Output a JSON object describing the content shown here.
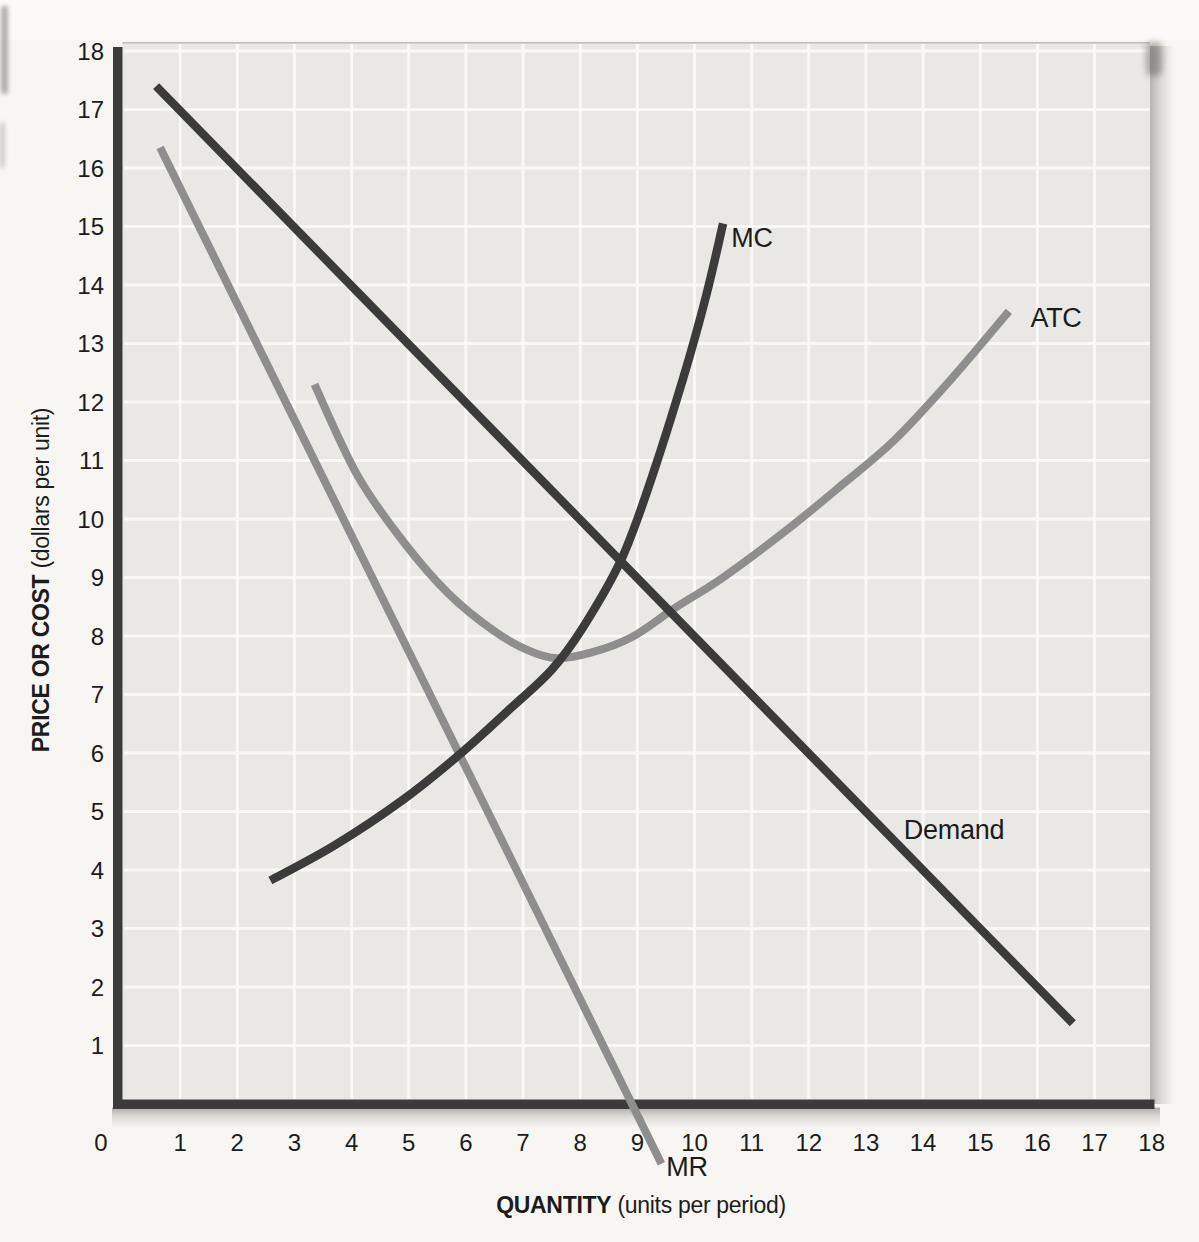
{
  "figure": {
    "x_axis_title_bold": "QUANTITY",
    "x_axis_title_rest": " (units per period)",
    "y_axis_title_bold": "PRICE OR COST",
    "y_axis_title_rest": " (dollars per unit)"
  },
  "colors": {
    "dark_curve": "#3b3b3b",
    "gray_curve": "#8e8e8e",
    "axis": "#3b3b3b",
    "plot_background": "#e9e8e5",
    "gridline": "#fbfaf8",
    "label_text": "#1c1c1c",
    "page_background": "#f7f6f3"
  },
  "chart_data": {
    "type": "line",
    "title": "",
    "xlabel": "QUANTITY (units per period)",
    "ylabel": "PRICE OR COST (dollars per unit)",
    "xlim": [
      0,
      18
    ],
    "ylim": [
      0,
      18
    ],
    "x_ticks": [
      0,
      1,
      2,
      3,
      4,
      5,
      6,
      7,
      8,
      9,
      10,
      11,
      12,
      13,
      14,
      15,
      16,
      17,
      18
    ],
    "y_ticks": [
      1,
      2,
      3,
      4,
      5,
      6,
      7,
      8,
      9,
      10,
      11,
      12,
      13,
      14,
      15,
      16,
      17,
      18
    ],
    "grid": true,
    "legend": "none (curves labeled inline)",
    "series": [
      {
        "name": "ATC",
        "label": "ATC",
        "shade": "gray",
        "shape": "u-curve",
        "points": [
          [
            3.35,
            12.3
          ],
          [
            4.1,
            10.75
          ],
          [
            4.9,
            9.62
          ],
          [
            5.7,
            8.72
          ],
          [
            6.5,
            8.08
          ],
          [
            7.1,
            7.75
          ],
          [
            7.6,
            7.62
          ],
          [
            8.2,
            7.72
          ],
          [
            8.9,
            7.98
          ],
          [
            9.66,
            8.48
          ],
          [
            10.5,
            9.0
          ],
          [
            11.6,
            9.8
          ],
          [
            12.6,
            10.6
          ],
          [
            13.5,
            11.35
          ],
          [
            14.5,
            12.4
          ],
          [
            15.5,
            13.55
          ]
        ]
      },
      {
        "name": "MR",
        "label": "MR",
        "shade": "gray",
        "shape": "straight",
        "points": [
          [
            0.65,
            16.35
          ],
          [
            9.42,
            -1.02
          ]
        ]
      },
      {
        "name": "Demand",
        "label": "Demand",
        "shade": "dark",
        "shape": "straight",
        "points": [
          [
            0.58,
            17.4
          ],
          [
            16.62,
            1.38
          ]
        ]
      },
      {
        "name": "MC",
        "label": "MC",
        "shade": "dark",
        "shape": "j-curve",
        "points": [
          [
            2.58,
            3.82
          ],
          [
            3.7,
            4.42
          ],
          [
            4.9,
            5.2
          ],
          [
            5.92,
            6.0
          ],
          [
            6.8,
            6.78
          ],
          [
            7.5,
            7.42
          ],
          [
            8.05,
            8.15
          ],
          [
            8.73,
            9.33
          ],
          [
            9.25,
            10.7
          ],
          [
            9.8,
            12.4
          ],
          [
            10.2,
            13.8
          ],
          [
            10.5,
            15.05
          ]
        ]
      }
    ],
    "curve_labels": [
      {
        "text": "MC",
        "x_px": 752,
        "y_px": 247
      },
      {
        "text": "ATC",
        "x_px": 1056,
        "y_px": 327
      },
      {
        "text": "Demand",
        "x_px": 954,
        "y_px": 839
      },
      {
        "text": "MR",
        "x_px": 687,
        "y_px": 1176
      }
    ],
    "notable_points": {
      "mc_mr_intersection": [
        5.9,
        6.0
      ],
      "mc_demand_intersection": [
        8.7,
        9.3
      ],
      "atc_demand_intersection": [
        9.66,
        8.48
      ],
      "atc_minimum": [
        7.6,
        7.62
      ],
      "mr_x_axis_intercept": 9.0
    }
  }
}
